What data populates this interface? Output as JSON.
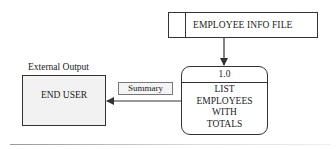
{
  "diagram": {
    "type": "data-flow-diagram",
    "data_store": {
      "label": "EMPLOYEE INFO FILE"
    },
    "process": {
      "id": "1.0",
      "lines": [
        "LIST",
        "EMPLOYEES",
        "WITH",
        "TOTALS"
      ]
    },
    "external_entity": {
      "caption": "External Output",
      "label": "END USER"
    },
    "flows": [
      {
        "from": "EMPLOYEE INFO FILE",
        "to": "1.0",
        "label": ""
      },
      {
        "from": "1.0",
        "to": "END USER",
        "label": "Summary"
      }
    ],
    "colors": {
      "stroke": "#333333",
      "entity_fill": "#f2f2f2",
      "label_fill": "#f4f4f4"
    }
  }
}
